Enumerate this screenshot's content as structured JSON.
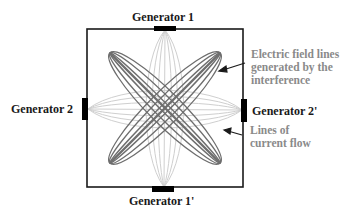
{
  "diagram": {
    "generators": {
      "top": "Generator 1",
      "bottom": "Generator 1'",
      "left": "Generator 2",
      "right": "Generator 2'"
    },
    "annotations": {
      "electric_field": [
        "Electric field lines",
        "generated by the",
        "interference"
      ],
      "current_flow": [
        "Lines of",
        "current flow"
      ]
    },
    "colors": {
      "box": "#1a1a1a",
      "generator": "#000000",
      "field_lines": "#6e6e6e",
      "current_lines": "#cfcfcf",
      "annotation_text": "#8a8a8a",
      "label_text": "#1a1a1a"
    }
  }
}
